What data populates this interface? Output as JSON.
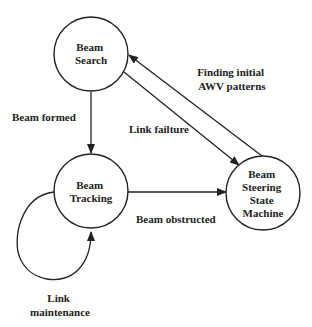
{
  "diagram": {
    "type": "state-machine",
    "colors": {
      "line": "#222222",
      "background": "#ffffff"
    },
    "nodes": [
      {
        "id": "beam_search",
        "lines": [
          "Beam",
          "Search"
        ],
        "cx": 91,
        "cy": 54,
        "r": 37
      },
      {
        "id": "beam_tracking",
        "lines": [
          "Beam",
          "Tracking"
        ],
        "cx": 91,
        "cy": 191,
        "r": 37
      },
      {
        "id": "beam_steering",
        "lines": [
          "Beam",
          "Steering",
          "State",
          "Machine"
        ],
        "cx": 263,
        "cy": 193,
        "r": 37
      }
    ],
    "edges": [
      {
        "id": "search_to_tracking",
        "from": "beam_search",
        "to": "beam_tracking",
        "label_lines": [
          "Beam formed"
        ]
      },
      {
        "id": "search_to_steering",
        "from": "beam_search",
        "to": "beam_steering",
        "label_lines": [
          "Link failture"
        ]
      },
      {
        "id": "steering_to_search",
        "from": "beam_steering",
        "to": "beam_search",
        "label_lines": [
          "Finding initial",
          "AWV patterns"
        ]
      },
      {
        "id": "tracking_to_steering",
        "from": "beam_tracking",
        "to": "beam_steering",
        "label_lines": [
          "Beam obstructed"
        ]
      },
      {
        "id": "tracking_self_loop",
        "from": "beam_tracking",
        "to": "beam_tracking",
        "label_lines": [
          "Link",
          "maintenance"
        ]
      }
    ]
  }
}
